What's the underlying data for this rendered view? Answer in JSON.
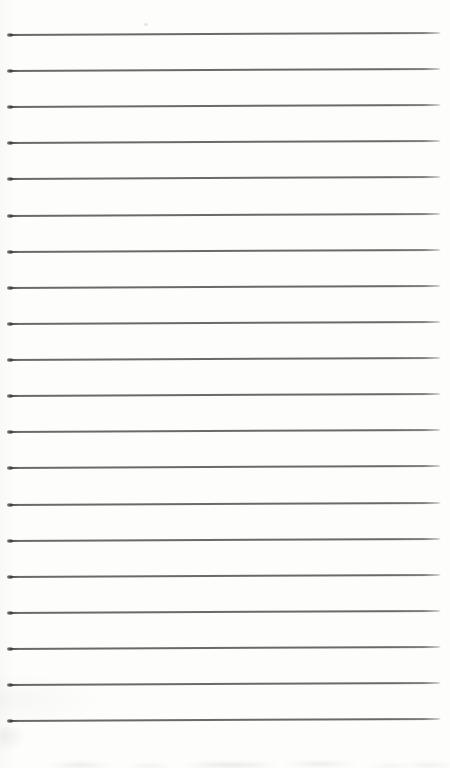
{
  "page": {
    "kind": "blank ruled notebook page",
    "text_content": "",
    "ruled_lines": {
      "count": 20
    },
    "colors": {
      "paper": "#fdfdfc",
      "rule_line": "#6a6a6a",
      "rule_line_start_dot": "#3e3e3e",
      "bottom_edge_shadow": "#e3e3e3"
    }
  }
}
